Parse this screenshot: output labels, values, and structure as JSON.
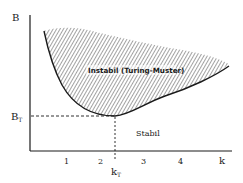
{
  "diagram": {
    "type": "phase-diagram",
    "axes": {
      "y_label": "B",
      "x_label": "k",
      "x_ticks": [
        "1",
        "2",
        "3",
        "4"
      ]
    },
    "markers": {
      "threshold_y_label": "B",
      "threshold_y_subscript": "T",
      "threshold_x_label": "k",
      "threshold_x_subscript": "T"
    },
    "regions": {
      "unstable": "Instabil (Turing-Muster)",
      "stable": "Stabil"
    },
    "colors": {
      "ink": "#1a1a1a",
      "background": "#ffffff",
      "hatch": "#333333"
    }
  }
}
